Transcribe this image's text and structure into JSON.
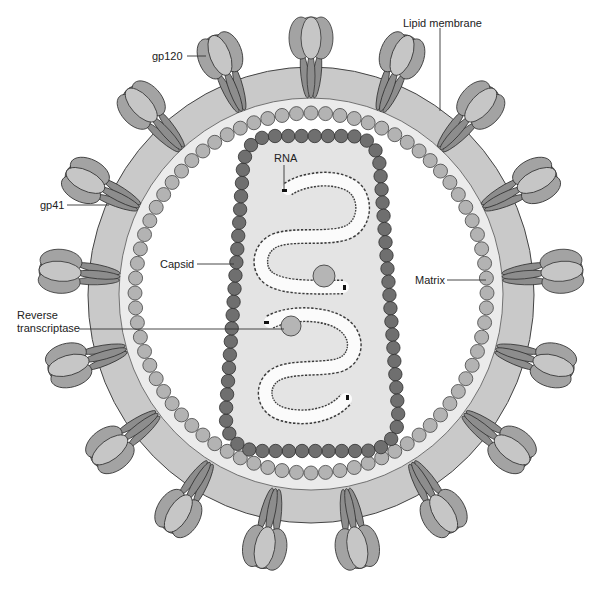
{
  "diagram": {
    "labels": {
      "gp120": "gp120",
      "lipid_membrane": "Lipid membrane",
      "gp41": "gp41",
      "capsid": "Capsid",
      "matrix": "Matrix",
      "reverse_transcriptase": [
        "Reverse",
        "transcriptase"
      ],
      "rna": "RNA"
    },
    "structure": {
      "envelope_spike_count": 17,
      "matrix_protein_count": 76,
      "rna_strand_count": 2,
      "reverse_transcriptase_count": 2
    },
    "colors": {
      "background": "#ffffff",
      "membrane": "#c9c9c9",
      "membrane_inner_band": "#ebebeb",
      "interior": "#ffffff",
      "matrix": "#b3b3b3",
      "capsid_shell": "#6f6f6f",
      "capsid_interior": "#e4e4e4",
      "spike_head_back": "#8f8f8f",
      "spike_head_side": "#a3a3a3",
      "spike_head_front": "#c6c6c6",
      "spike_stalk": "#8d8d8d",
      "reverse_transcriptase": "#b5b5b5",
      "rna_fill": "#fbfbfb",
      "rna_edge": "#3a3a3a",
      "outline": "#333333"
    }
  }
}
